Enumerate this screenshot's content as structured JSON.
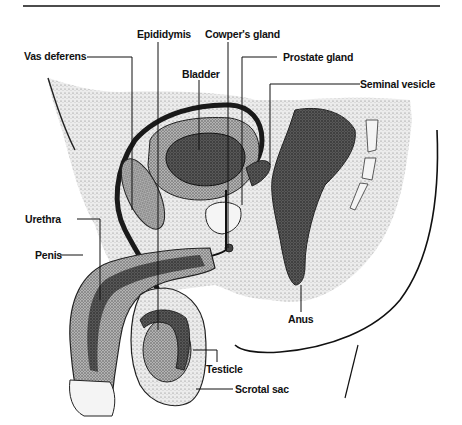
{
  "diagram": {
    "labels": {
      "vas_deferens": "Vas deferens",
      "epididymis": "Epididymis",
      "cowpers_gland": "Cowper's gland",
      "prostate_gland": "Prostate gland",
      "bladder": "Bladder",
      "seminal_vesicle": "Seminal vesicle",
      "urethra": "Urethra",
      "penis": "Penis",
      "anus": "Anus",
      "testicle": "Testicle",
      "scrotal_sac": "Scrotal sac"
    },
    "colors": {
      "ink": "#111111",
      "stipple_dark": "#3a3a3a",
      "stipple_mid": "#8a8a8a",
      "stipple_light": "#c8c8c8",
      "background": "#ffffff"
    }
  }
}
